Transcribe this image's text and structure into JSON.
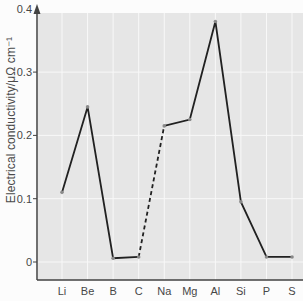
{
  "figure": {
    "background_color": "#fcfcfc",
    "plot_background_color": "#e6e6e6",
    "gridline_color": "#f8f8f8",
    "axis_color": "#424242",
    "line_color": "#212121",
    "marker_color": "#8a8a8a",
    "text_color": "#474747"
  },
  "chart_data": {
    "type": "line",
    "title": "",
    "xlabel": "",
    "ylabel": "Electrical conductivity/μΩ cm⁻¹",
    "categories": [
      "Li",
      "Be",
      "B",
      "C",
      "Na",
      "Mg",
      "Al",
      "Si",
      "P",
      "S"
    ],
    "values": [
      0.11,
      0.245,
      0.006,
      0.008,
      0.215,
      0.225,
      0.38,
      0.095,
      0.008,
      0.008
    ],
    "ylim": [
      0,
      0.4
    ],
    "yticks": [
      0,
      0.1,
      0.2,
      0.3,
      0.4
    ],
    "ytick_labels": [
      "0",
      "0.1",
      "0.2",
      "0.3",
      "0.4"
    ],
    "grid": true,
    "legend": "none",
    "segments": [
      {
        "from": 0,
        "to": 3,
        "style": "solid"
      },
      {
        "from": 3,
        "to": 4,
        "style": "dashed"
      },
      {
        "from": 4,
        "to": 9,
        "style": "solid"
      }
    ]
  }
}
